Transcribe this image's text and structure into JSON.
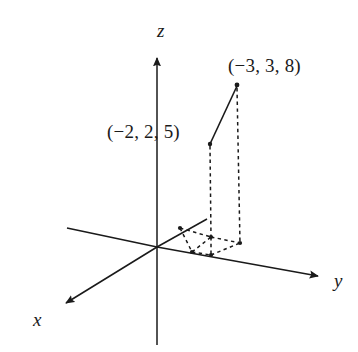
{
  "figure": {
    "kind": "3d-coordinate-axes-diagram",
    "width": 358,
    "height": 352,
    "background_color": "#ffffff",
    "stroke_color": "#1a1a1a"
  },
  "axes": {
    "z": {
      "label": "z",
      "icon": "arrow-up-icon",
      "origin": [
        157,
        247
      ],
      "positive_end": [
        157,
        55
      ],
      "negative_end": [
        157,
        345
      ],
      "arrow_at": "positive_end"
    },
    "y": {
      "label": "y",
      "icon": "arrow-right-icon",
      "origin": [
        157,
        247
      ],
      "positive_end": [
        322,
        277
      ],
      "negative_end": [
        67,
        228
      ],
      "arrow_at": "positive_end"
    },
    "x": {
      "label": "x",
      "icon": "arrow-down-left-icon",
      "origin": [
        157,
        247
      ],
      "positive_end": [
        62,
        305
      ],
      "negative_end": [
        207,
        219
      ],
      "arrow_at": "positive_end"
    }
  },
  "points": [
    {
      "id": "point-far",
      "label": "(−3, 3, 8)",
      "coordinates": [
        -3,
        3,
        8
      ],
      "screen": [
        237,
        85
      ],
      "label_screen": [
        228,
        56
      ],
      "drop_line_foot": [
        240,
        243
      ]
    },
    {
      "id": "point-near",
      "label": "(−2, 2, 5)",
      "coordinates": [
        -2,
        2,
        5
      ],
      "screen": [
        210,
        144
      ],
      "label_screen": [
        107,
        122
      ],
      "drop_line_foot": [
        211,
        237
      ]
    }
  ],
  "segments": [
    {
      "name": "point-connector-segment",
      "style": "solid",
      "from": [
        210,
        144
      ],
      "to": [
        237,
        85
      ]
    }
  ],
  "projection_lines": [
    {
      "name": "drop-line-near",
      "style": "dashed",
      "from": [
        210,
        144
      ],
      "to": [
        211,
        237
      ]
    },
    {
      "name": "drop-line-far",
      "style": "dashed",
      "from": [
        237,
        85
      ],
      "to": [
        240,
        243
      ]
    }
  ],
  "base_nodes": [
    [
      180,
      228
    ],
    [
      211,
      237
    ],
    [
      240,
      243
    ],
    [
      192,
      252
    ],
    [
      211,
      255
    ],
    [
      163,
      245
    ]
  ],
  "base_edges": [
    {
      "name": "base-edge-a",
      "style": "dashed",
      "from": [
        180,
        228
      ],
      "to": [
        211,
        237
      ]
    },
    {
      "name": "base-edge-b",
      "style": "dashed",
      "from": [
        211,
        237
      ],
      "to": [
        240,
        243
      ]
    },
    {
      "name": "base-edge-c",
      "style": "dashed",
      "from": [
        180,
        228
      ],
      "to": [
        192,
        252
      ]
    },
    {
      "name": "base-edge-d",
      "style": "dashed",
      "from": [
        192,
        252
      ],
      "to": [
        211,
        255
      ]
    },
    {
      "name": "base-edge-e",
      "style": "dashed",
      "from": [
        211,
        255
      ],
      "to": [
        240,
        243
      ]
    },
    {
      "name": "base-edge-f",
      "style": "dashed",
      "from": [
        192,
        252
      ],
      "to": [
        211,
        237
      ]
    },
    {
      "name": "base-edge-g",
      "style": "dashed",
      "from": [
        211,
        237
      ],
      "to": [
        211,
        255
      ]
    }
  ]
}
